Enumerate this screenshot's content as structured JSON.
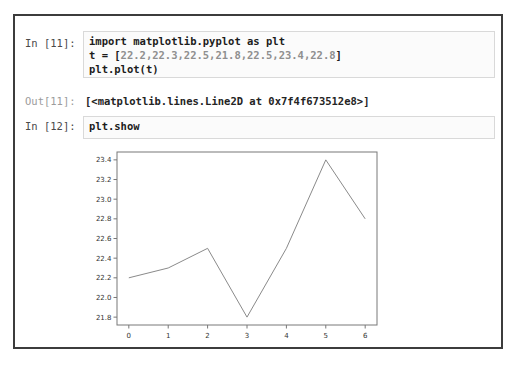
{
  "notebook": {
    "cell1": {
      "prompt": "In [11]:",
      "line1": "import matplotlib.pyplot as plt",
      "line2_prefix": "t = [",
      "line2_numbers": "22.2,22.3,22.5,21.8,22.5,23.4,22.8",
      "line2_suffix": "]",
      "line3": "plt.plot(t)"
    },
    "out1": {
      "prompt": "Out[11]:",
      "text": "[<matplotlib.lines.Line2D at 0x7f4f673512e8>]"
    },
    "cell2": {
      "prompt": "In [12]:",
      "line1": "plt.show"
    }
  },
  "chart_data": {
    "type": "line",
    "title": "",
    "xlabel": "",
    "ylabel": "",
    "x": [
      0,
      1,
      2,
      3,
      4,
      5,
      6
    ],
    "values": [
      22.2,
      22.3,
      22.5,
      21.8,
      22.5,
      23.4,
      22.8
    ],
    "xticks": [
      0,
      1,
      2,
      3,
      4,
      5,
      6
    ],
    "yticks": [
      21.8,
      22.0,
      22.2,
      22.4,
      22.6,
      22.8,
      23.0,
      23.2,
      23.4
    ],
    "xlim": [
      -0.3,
      6.3
    ],
    "ylim": [
      21.72,
      23.48
    ],
    "grid": false,
    "legend": "none",
    "line_color": "#8a8a8a",
    "axes_color": "#787878",
    "tick_label_color": "#333333"
  }
}
